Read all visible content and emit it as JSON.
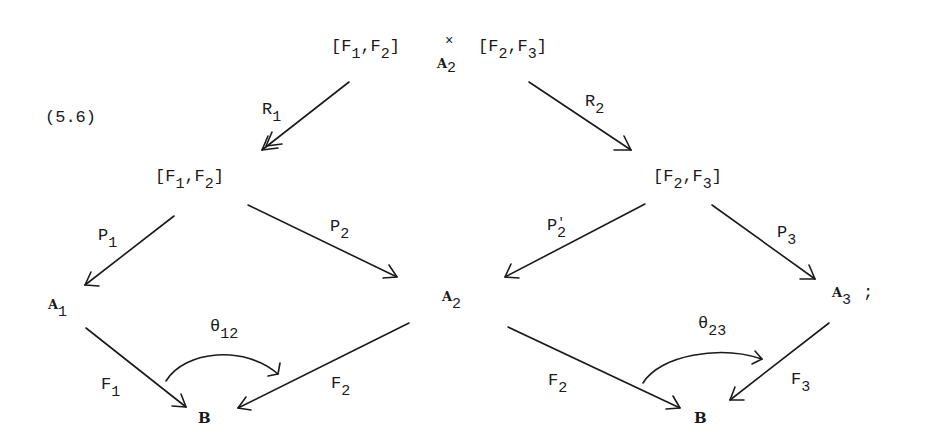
{
  "equation_label": "(5.6)",
  "nodes": {
    "top_left": {
      "open": "[F",
      "s1": "1",
      "mid": ",F",
      "s2": "2",
      "close": "]"
    },
    "top_times": "×",
    "top_over_sym": "A",
    "top_over_sub": "2",
    "top_right": {
      "open": "[F",
      "s1": "2",
      "mid": ",F",
      "s2": "3",
      "close": "]"
    },
    "mid_left": {
      "open": "[F",
      "s1": "1",
      "mid": ",F",
      "s2": "2",
      "close": "]"
    },
    "mid_right": {
      "open": "[F",
      "s1": "2",
      "mid": ",F",
      "s2": "3",
      "close": "]"
    },
    "A1": {
      "sym": "A",
      "sub": "1"
    },
    "A2": {
      "sym": "A",
      "sub": "2"
    },
    "A3": {
      "sym": "A",
      "sub": "3",
      "trail": ";"
    },
    "B_left": "B",
    "B_right": "B"
  },
  "arrows": {
    "R1": {
      "sym": "R",
      "sub": "1"
    },
    "R2": {
      "sym": "R",
      "sub": "2"
    },
    "P1": {
      "sym": "P",
      "sub": "1"
    },
    "P2": {
      "sym": "P",
      "sub": "2"
    },
    "P2prime": {
      "sym": "P",
      "prime": "'",
      "sub": "2"
    },
    "P3": {
      "sym": "P",
      "sub": "3"
    },
    "F1": {
      "sym": "F",
      "sub": "1"
    },
    "F2_left": {
      "sym": "F",
      "sub": "2"
    },
    "F2_right": {
      "sym": "F",
      "sub": "2"
    },
    "F3": {
      "sym": "F",
      "sub": "3"
    },
    "theta12": {
      "sym": "θ",
      "sub": "12"
    },
    "theta23": {
      "sym": "θ",
      "sub": "23"
    }
  }
}
